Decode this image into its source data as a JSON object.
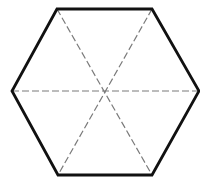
{
  "diagram": {
    "type": "regular-hexagon-with-diagonals",
    "shape": "hexagon",
    "vertices": [
      {
        "name": "top-left",
        "x": 57,
        "y": 9
      },
      {
        "name": "top-right",
        "x": 152,
        "y": 9
      },
      {
        "name": "right",
        "x": 199,
        "y": 91
      },
      {
        "name": "bottom-right",
        "x": 152,
        "y": 175
      },
      {
        "name": "bottom-left",
        "x": 58,
        "y": 175
      },
      {
        "name": "left",
        "x": 12,
        "y": 91
      }
    ],
    "center": {
      "x": 105,
      "y": 91
    },
    "diagonals": [
      {
        "name": "horizontal-diagonal",
        "from": "left",
        "to": "right"
      },
      {
        "name": "descending-diagonal",
        "from": "top-left",
        "to": "bottom-right"
      },
      {
        "name": "ascending-diagonal",
        "from": "top-right",
        "to": "bottom-left"
      }
    ],
    "styles": {
      "edge_color": "#111111",
      "edge_width": 2.8,
      "diagonal_color": "#7a7a7a",
      "diagonal_width": 1.2,
      "diagonal_dash": "7 3",
      "background": "#ffffff"
    }
  }
}
